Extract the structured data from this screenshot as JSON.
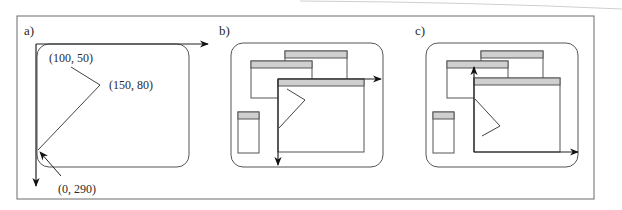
{
  "figure": {
    "panels": [
      {
        "label": "a)",
        "annotations": {
          "point_1": "(100, 50)",
          "point_2": "(150, 80)",
          "point_3": "(0, 290)"
        }
      },
      {
        "label": "b)"
      },
      {
        "label": "c)"
      }
    ]
  },
  "colors": {
    "line": "#3a3a3a",
    "frame": "#6a6a6a",
    "title_bar": "#cfcfcf",
    "background": "#ffffff"
  }
}
